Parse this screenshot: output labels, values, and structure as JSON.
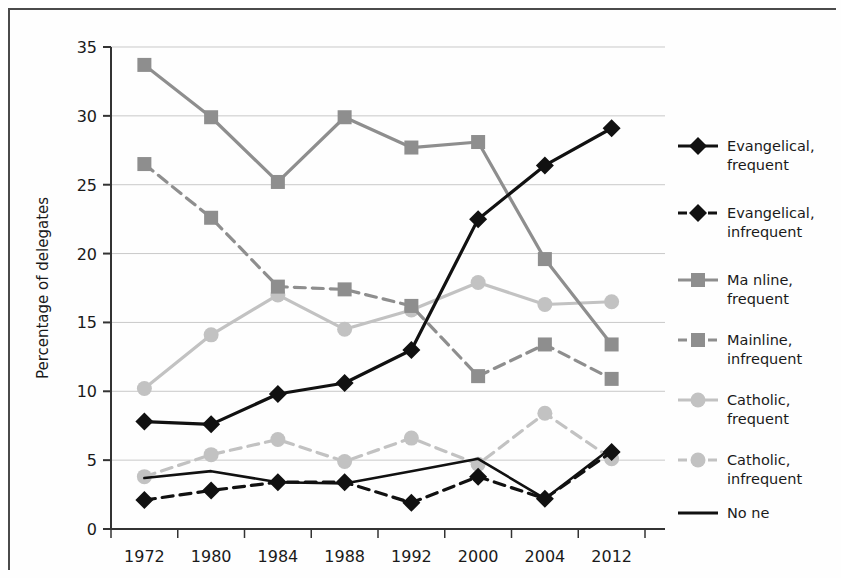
{
  "chart_data": {
    "type": "line",
    "title": "",
    "xlabel": "",
    "ylabel": "Percentage of delegates",
    "categories": [
      "1972",
      "1980",
      "1984",
      "1988",
      "1992",
      "2000",
      "2004",
      "2012"
    ],
    "ylim": [
      0,
      35
    ],
    "yticks": [
      0,
      5,
      10,
      15,
      20,
      25,
      30,
      35
    ],
    "ytick_labels": [
      "0",
      "5",
      "10",
      "15",
      "20",
      "25",
      "30",
      "35"
    ],
    "grid": true,
    "legend_position": "right",
    "series": [
      {
        "name": "Evangelical, frequent",
        "label_line1": "Evangelical,",
        "label_line2": "frequent",
        "color": "#111111",
        "dash": "solid",
        "marker": "diamond",
        "values": [
          7.8,
          7.6,
          9.8,
          10.6,
          13.0,
          22.5,
          26.4,
          29.1
        ]
      },
      {
        "name": "Evangelical, infrequent",
        "label_line1": "Evangelical,",
        "label_line2": "infrequent",
        "color": "#111111",
        "dash": "dashed",
        "marker": "diamond",
        "values": [
          2.1,
          2.8,
          3.4,
          3.4,
          1.9,
          3.8,
          2.2,
          5.6
        ]
      },
      {
        "name": "Mainline, frequent",
        "label_line1": "Ma nline,",
        "label_line2": "frequent",
        "color": "#8e8e8e",
        "dash": "solid",
        "marker": "square",
        "values": [
          33.7,
          29.9,
          25.2,
          29.9,
          27.7,
          28.1,
          19.6,
          13.4
        ]
      },
      {
        "name": "Mainline, infrequent",
        "label_line1": "Mainline,",
        "label_line2": "infrequent",
        "color": "#8e8e8e",
        "dash": "dashed",
        "marker": "square",
        "values": [
          26.5,
          22.6,
          17.6,
          17.4,
          16.2,
          11.1,
          13.4,
          10.9
        ]
      },
      {
        "name": "Catholic, frequent",
        "label_line1": "Catholic,",
        "label_line2": "frequent",
        "color": "#c2c2c2",
        "dash": "solid",
        "marker": "circle",
        "values": [
          10.2,
          14.1,
          17.0,
          14.5,
          15.9,
          17.9,
          16.3,
          16.5
        ]
      },
      {
        "name": "Catholic, infrequent",
        "label_line1": "Catholic,",
        "label_line2": "infrequent",
        "color": "#c2c2c2",
        "dash": "dashed",
        "marker": "circle",
        "values": [
          3.8,
          5.4,
          6.5,
          4.9,
          6.6,
          4.7,
          8.4,
          5.1
        ]
      },
      {
        "name": "None",
        "label_line1": "No ne",
        "label_line2": "",
        "color": "#111111",
        "dash": "solid",
        "marker": "none",
        "values": [
          3.7,
          4.2,
          3.4,
          3.3,
          4.2,
          5.1,
          2.2,
          5.9
        ]
      }
    ]
  },
  "axes": {
    "y_axis_title": "Percentage of delegates"
  }
}
